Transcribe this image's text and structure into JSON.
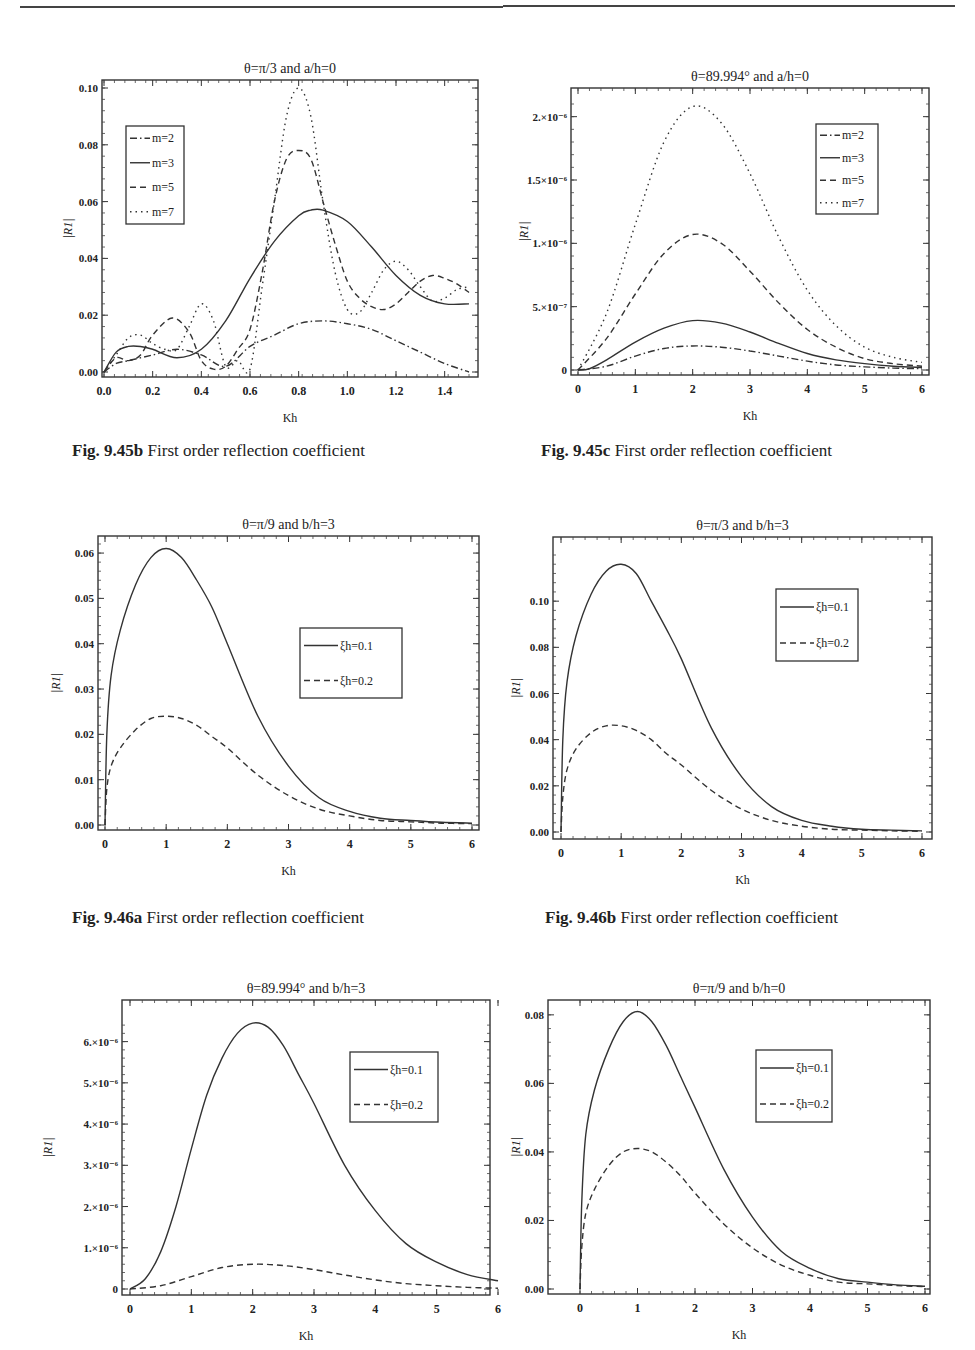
{
  "page": {
    "header_fragment": "…graphy"
  },
  "figures": [
    {
      "id": "fig-9-45b",
      "caption_label": "Fig. 9.45b",
      "caption_text": "First order reflection coefficient"
    },
    {
      "id": "fig-9-45c",
      "caption_label": "Fig. 9.45c",
      "caption_text": "First order reflection coefficient"
    },
    {
      "id": "fig-9-46a",
      "caption_label": "Fig. 9.46a",
      "caption_text": "First order reflection coefficient"
    },
    {
      "id": "fig-9-46b",
      "caption_label": "Fig. 9.46b",
      "caption_text": "First order reflection coefficient"
    }
  ],
  "chart_data": [
    {
      "type": "line",
      "title": "θ=π/3 and a/h=0",
      "xlabel": "Kh",
      "ylabel": "|R1|",
      "xlim": [
        0,
        1.5
      ],
      "ylim": [
        0,
        0.1
      ],
      "xticks": [
        "0.0",
        "0.2",
        "0.4",
        "0.6",
        "0.8",
        "1.0",
        "1.2",
        "1.4"
      ],
      "yticks": [
        "0.00",
        "0.02",
        "0.04",
        "0.06",
        "0.08",
        "0.10"
      ],
      "legend_position": "upper-left",
      "grid": false,
      "series": [
        {
          "name": "m=2",
          "style": "dashdot",
          "x": [
            0,
            0.05,
            0.1,
            0.2,
            0.3,
            0.4,
            0.5,
            0.6,
            0.7,
            0.8,
            0.9,
            1.0,
            1.1,
            1.2,
            1.3,
            1.4,
            1.5
          ],
          "y": [
            0,
            0.003,
            0.004,
            0.006,
            0.008,
            0.006,
            0.002,
            0.009,
            0.013,
            0.017,
            0.018,
            0.017,
            0.015,
            0.011,
            0.007,
            0.003,
            0.0
          ]
        },
        {
          "name": "m=3",
          "style": "solid",
          "x": [
            0,
            0.05,
            0.1,
            0.15,
            0.2,
            0.3,
            0.4,
            0.5,
            0.6,
            0.7,
            0.8,
            0.85,
            0.9,
            1.0,
            1.1,
            1.2,
            1.3,
            1.4,
            1.5
          ],
          "y": [
            0,
            0.007,
            0.009,
            0.009,
            0.008,
            0.005,
            0.008,
            0.018,
            0.033,
            0.046,
            0.055,
            0.057,
            0.057,
            0.053,
            0.044,
            0.034,
            0.027,
            0.024,
            0.024
          ]
        },
        {
          "name": "m=5",
          "style": "dashed",
          "x": [
            0,
            0.05,
            0.1,
            0.15,
            0.2,
            0.28,
            0.35,
            0.4,
            0.45,
            0.5,
            0.55,
            0.6,
            0.65,
            0.7,
            0.75,
            0.8,
            0.85,
            0.9,
            0.95,
            1.0,
            1.05,
            1.1,
            1.15,
            1.2,
            1.25,
            1.3,
            1.35,
            1.4,
            1.45,
            1.5
          ],
          "y": [
            0,
            0.005,
            0.004,
            0.006,
            0.013,
            0.019,
            0.014,
            0.004,
            0.001,
            0.002,
            0.008,
            0.015,
            0.035,
            0.06,
            0.075,
            0.078,
            0.075,
            0.06,
            0.045,
            0.032,
            0.026,
            0.023,
            0.022,
            0.024,
            0.028,
            0.032,
            0.034,
            0.033,
            0.031,
            0.028
          ]
        },
        {
          "name": "m=7",
          "style": "dotted",
          "x": [
            0,
            0.05,
            0.1,
            0.15,
            0.2,
            0.25,
            0.3,
            0.35,
            0.4,
            0.45,
            0.5,
            0.55,
            0.6,
            0.65,
            0.7,
            0.75,
            0.8,
            0.85,
            0.9,
            0.95,
            1.0,
            1.05,
            1.1,
            1.15,
            1.2,
            1.25,
            1.3,
            1.35,
            1.4,
            1.45,
            1.5
          ],
          "y": [
            0,
            0.006,
            0.012,
            0.013,
            0.01,
            0.008,
            0.008,
            0.016,
            0.024,
            0.018,
            0.002,
            0.004,
            0.001,
            0.03,
            0.06,
            0.09,
            0.1,
            0.09,
            0.06,
            0.035,
            0.022,
            0.021,
            0.028,
            0.036,
            0.039,
            0.036,
            0.03,
            0.025,
            0.026,
            0.029,
            0.03
          ]
        }
      ]
    },
    {
      "type": "line",
      "title": "θ=89.994° and a/h=0",
      "xlabel": "Kh",
      "ylabel": "|R1|",
      "xlim": [
        0,
        6
      ],
      "ylim": [
        0,
        2.1e-06
      ],
      "xticks": [
        "0",
        "1",
        "2",
        "3",
        "4",
        "5",
        "6"
      ],
      "yticks": [
        "0",
        "5.×10⁻⁷",
        "1.×10⁻⁶",
        "1.5×10⁻⁶",
        "2.×10⁻⁶"
      ],
      "legend_position": "upper-right",
      "grid": false,
      "series": [
        {
          "name": "m=2",
          "style": "dashdot",
          "x": [
            0,
            0.5,
            1,
            1.5,
            2,
            2.5,
            3,
            3.5,
            4,
            4.5,
            5,
            5.5,
            6
          ],
          "y": [
            0,
            3e-08,
            1.1e-07,
            1.7e-07,
            1.9e-07,
            1.8e-07,
            1.5e-07,
            1.1e-07,
            7e-08,
            4e-08,
            2.5e-08,
            1.5e-08,
            1e-08
          ]
        },
        {
          "name": "m=3",
          "style": "solid",
          "x": [
            0,
            0.2,
            0.5,
            1,
            1.5,
            2,
            2.5,
            3,
            3.5,
            4,
            4.5,
            5,
            5.5,
            6
          ],
          "y": [
            0,
            1e-08,
            8e-08,
            2.2e-07,
            3.3e-07,
            3.9e-07,
            3.7e-07,
            3e-07,
            2.1e-07,
            1.3e-07,
            8e-08,
            5e-08,
            3e-08,
            2e-08
          ]
        },
        {
          "name": "m=5",
          "style": "dashed",
          "x": [
            0,
            0.5,
            1,
            1.5,
            2,
            2.5,
            3,
            3.5,
            4,
            4.5,
            5,
            5.5,
            6
          ],
          "y": [
            0,
            2.5e-07,
            6e-07,
            9.2e-07,
            1.07e-06,
            1e-06,
            7.8e-07,
            5.3e-07,
            3.2e-07,
            1.8e-07,
            9e-08,
            5e-08,
            3e-08
          ]
        },
        {
          "name": "m=7",
          "style": "dotted",
          "x": [
            0,
            0.5,
            1,
            1.5,
            2,
            2.5,
            3,
            3.5,
            4,
            4.5,
            5,
            5.5,
            6
          ],
          "y": [
            0,
            4.5e-07,
            1.15e-06,
            1.8e-06,
            2.08e-06,
            1.95e-06,
            1.55e-06,
            1.05e-06,
            6.3e-07,
            3.5e-07,
            1.8e-07,
            1e-07,
            6e-08
          ]
        }
      ]
    },
    {
      "type": "line",
      "title": "θ=π/9 and b/h=3",
      "xlabel": "Kh",
      "ylabel": "|R1|",
      "xlim": [
        0,
        6
      ],
      "ylim": [
        0,
        0.062
      ],
      "xticks": [
        "0",
        "1",
        "2",
        "3",
        "4",
        "5",
        "6"
      ],
      "yticks": [
        "0.00",
        "0.01",
        "0.02",
        "0.03",
        "0.04",
        "0.05",
        "0.06"
      ],
      "legend_position": "center-right",
      "grid": false,
      "series": [
        {
          "name": "ξh=0.1",
          "style": "solid",
          "x": [
            0,
            0.03,
            0.1,
            0.25,
            0.5,
            0.75,
            1,
            1.25,
            1.5,
            1.75,
            2,
            2.5,
            3,
            3.5,
            4,
            4.5,
            5,
            5.5,
            6
          ],
          "y": [
            0,
            0.02,
            0.033,
            0.043,
            0.053,
            0.059,
            0.061,
            0.059,
            0.054,
            0.048,
            0.04,
            0.024,
            0.013,
            0.006,
            0.003,
            0.0015,
            0.001,
            0.0006,
            0.0004
          ]
        },
        {
          "name": "ξh=0.2",
          "style": "dashed",
          "x": [
            0,
            0.03,
            0.1,
            0.25,
            0.5,
            0.75,
            1,
            1.25,
            1.5,
            1.75,
            2,
            2.5,
            3,
            3.5,
            4,
            4.5,
            5,
            5.5,
            6
          ],
          "y": [
            0,
            0.008,
            0.013,
            0.017,
            0.021,
            0.0235,
            0.024,
            0.0235,
            0.022,
            0.0195,
            0.017,
            0.011,
            0.0065,
            0.0035,
            0.002,
            0.001,
            0.0007,
            0.0004,
            0.0003
          ]
        }
      ]
    },
    {
      "type": "line",
      "title": "θ=π/3 and b/h=3",
      "xlabel": "Kh",
      "ylabel": "|R1|",
      "xlim": [
        0,
        6
      ],
      "ylim": [
        0,
        0.12
      ],
      "xticks": [
        "0",
        "1",
        "2",
        "3",
        "4",
        "5",
        "6"
      ],
      "yticks": [
        "0.00",
        "0.02",
        "0.04",
        "0.06",
        "0.08",
        "0.10"
      ],
      "legend_position": "upper-right",
      "grid": false,
      "series": [
        {
          "name": "ξh=0.1",
          "style": "solid",
          "x": [
            0,
            0.03,
            0.1,
            0.25,
            0.5,
            0.75,
            1,
            1.25,
            1.5,
            1.75,
            2,
            2.5,
            3,
            3.5,
            4,
            4.5,
            5,
            5.5,
            6
          ],
          "y": [
            0,
            0.04,
            0.065,
            0.085,
            0.103,
            0.113,
            0.116,
            0.112,
            0.1,
            0.088,
            0.075,
            0.045,
            0.024,
            0.011,
            0.005,
            0.0025,
            0.0012,
            0.0008,
            0.0005
          ]
        },
        {
          "name": "ξh=0.2",
          "style": "dashed",
          "x": [
            0,
            0.03,
            0.1,
            0.25,
            0.5,
            0.75,
            1,
            1.25,
            1.5,
            1.75,
            2,
            2.5,
            3,
            3.5,
            4,
            4.5,
            5,
            5.5,
            6
          ],
          "y": [
            0,
            0.015,
            0.027,
            0.036,
            0.043,
            0.046,
            0.046,
            0.044,
            0.04,
            0.034,
            0.029,
            0.018,
            0.01,
            0.005,
            0.0025,
            0.0012,
            0.0008,
            0.0005,
            0.0003
          ]
        }
      ]
    },
    {
      "type": "line",
      "title": "θ=89.994° and b/h=3",
      "xlabel": "Kh",
      "ylabel": "|R1|",
      "xlim": [
        0,
        6
      ],
      "ylim": [
        0,
        6.5e-06
      ],
      "xticks": [
        "0",
        "1",
        "2",
        "3",
        "4",
        "5",
        "6"
      ],
      "yticks": [
        "0",
        "1.×10⁻⁶",
        "2.×10⁻⁶",
        "3.×10⁻⁶",
        "4.×10⁻⁶",
        "5.×10⁻⁶",
        "6.×10⁻⁶"
      ],
      "legend_position": "upper-right",
      "grid": false,
      "series": [
        {
          "name": "ξh=0.1",
          "style": "solid",
          "x": [
            0,
            0.25,
            0.5,
            0.75,
            1,
            1.25,
            1.5,
            1.75,
            2,
            2.25,
            2.5,
            2.75,
            3,
            3.5,
            4,
            4.5,
            5,
            5.5,
            6
          ],
          "y": [
            0,
            2.5e-07,
            9e-07,
            2e-06,
            3.4e-06,
            4.7e-06,
            5.6e-06,
            6.2e-06,
            6.45e-06,
            6.35e-06,
            5.9e-06,
            5.2e-06,
            4.5e-06,
            3e-06,
            1.9e-06,
            1.1e-06,
            6.5e-07,
            3.5e-07,
            2e-07
          ]
        },
        {
          "name": "ξh=0.2",
          "style": "dashed",
          "x": [
            0,
            0.5,
            1,
            1.5,
            2,
            2.5,
            3,
            3.5,
            4,
            4.5,
            5,
            5.5,
            6
          ],
          "y": [
            0,
            8e-08,
            3e-07,
            5.2e-07,
            6e-07,
            5.7e-07,
            4.7e-07,
            3.4e-07,
            2.2e-07,
            1.3e-07,
            8e-08,
            4e-08,
            2e-08
          ]
        }
      ]
    },
    {
      "type": "line",
      "title": "θ=π/9 and b/h=0",
      "xlabel": "Kh",
      "ylabel": "|R1|",
      "xlim": [
        0,
        6
      ],
      "ylim": [
        0,
        0.082
      ],
      "xticks": [
        "0",
        "1",
        "2",
        "3",
        "4",
        "5",
        "6"
      ],
      "yticks": [
        "0.00",
        "0.02",
        "0.04",
        "0.06",
        "0.08"
      ],
      "legend_position": "upper-right",
      "grid": false,
      "series": [
        {
          "name": "ξh=0.1",
          "style": "solid",
          "x": [
            0,
            0.03,
            0.1,
            0.25,
            0.5,
            0.75,
            1,
            1.25,
            1.5,
            1.75,
            2,
            2.5,
            3,
            3.5,
            4,
            4.5,
            5,
            5.5,
            6
          ],
          "y": [
            0,
            0.025,
            0.045,
            0.058,
            0.07,
            0.078,
            0.081,
            0.078,
            0.071,
            0.062,
            0.053,
            0.035,
            0.021,
            0.011,
            0.006,
            0.003,
            0.002,
            0.0012,
            0.0008
          ]
        },
        {
          "name": "ξh=0.2",
          "style": "dashed",
          "x": [
            0,
            0.03,
            0.1,
            0.25,
            0.5,
            0.75,
            1,
            1.25,
            1.5,
            1.75,
            2,
            2.5,
            3,
            3.5,
            4,
            4.5,
            5,
            5.5,
            6
          ],
          "y": [
            0,
            0.012,
            0.022,
            0.029,
            0.036,
            0.04,
            0.041,
            0.04,
            0.037,
            0.033,
            0.028,
            0.019,
            0.012,
            0.007,
            0.004,
            0.002,
            0.0015,
            0.001,
            0.0007
          ]
        }
      ]
    }
  ]
}
